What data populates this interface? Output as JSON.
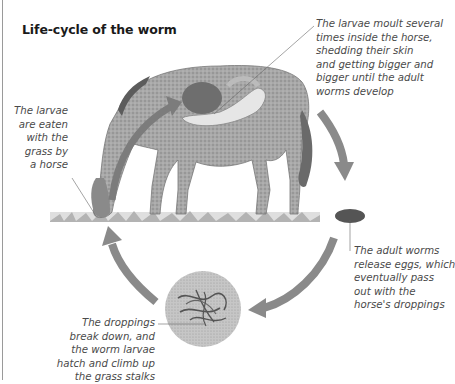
{
  "title": "Life-cycle of the worm",
  "captions": {
    "eaten": [
      "The larvae",
      "are eaten",
      "with the",
      "grass by",
      "a horse"
    ],
    "moult": [
      "The larvae moult several",
      "times inside the horse,",
      "shedding their skin",
      "and getting bigger and",
      "bigger until the adult",
      "worms develop"
    ],
    "eggs": [
      "The adult worms",
      "release eggs, which",
      "eventually pass",
      "out with the",
      "horse's droppings"
    ],
    "hatch": [
      "The droppings",
      "break down, and",
      "the worm larvae",
      "hatch and climb up",
      "the grass stalks"
    ]
  },
  "colors": {
    "arrow": "#8a8a8a",
    "arrow_edge": "#6e6e6e",
    "horse": "#9c9c9c",
    "horse_dark": "#6a6a6a",
    "grass": "#9a9a9a",
    "circle": "#c4c4c4",
    "worms": "#555555",
    "text": "#4a4a4a",
    "title": "#1a1a1a"
  }
}
